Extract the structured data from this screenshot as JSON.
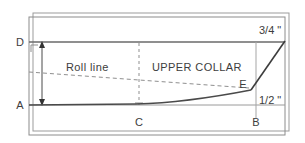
{
  "diagram": {
    "colors": {
      "frame": "#8c8c8c",
      "outline": "#4a4a4a",
      "construction": "#9a9a9a",
      "dashed": "#8f8f8f",
      "text": "#3d3d3d",
      "background": "#ffffff"
    },
    "points": [
      {
        "id": "D",
        "label": "D",
        "x": 20,
        "y": 46
      },
      {
        "id": "A",
        "label": "A",
        "x": 20,
        "y": 109
      },
      {
        "id": "C",
        "label": "C",
        "x": 135,
        "y": 126
      },
      {
        "id": "B",
        "label": "B",
        "x": 252,
        "y": 126
      },
      {
        "id": "E",
        "label": "E",
        "x": 239,
        "y": 88
      }
    ],
    "measurements": [
      {
        "id": "top-right",
        "label": "3/4 \"",
        "x": 258,
        "y": 34
      },
      {
        "id": "bottom-right",
        "label": "1/2 \"",
        "x": 259,
        "y": 103
      }
    ],
    "annotations": [
      {
        "id": "roll-line",
        "label": "Roll line",
        "x": 66,
        "y": 70
      },
      {
        "id": "upper-collar",
        "label": "UPPER COLLAR",
        "x": 150,
        "y": 70
      }
    ]
  }
}
